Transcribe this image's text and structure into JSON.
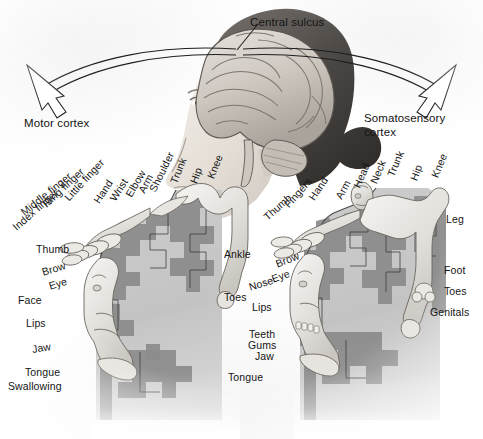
{
  "figure": {
    "background_color": "#ffffff",
    "text_color": "#151515",
    "cortex_light_gray": "#c6c6c6",
    "cortex_dark_gray": "#8b8b8b",
    "body_light": "#ededed",
    "outline_color": "#2b2b2b"
  },
  "callouts": {
    "central_sulcus": "Central sulcus",
    "motor_cortex": "Motor cortex",
    "somatosensory_cortex_line1": "Somatosensory",
    "somatosensory_cortex_line2": "cortex"
  },
  "motor_homunculus": {
    "panel_label": "Motor cortex",
    "arc_labels": [
      {
        "text": "Index finger",
        "x": 14,
        "y": 222,
        "angle": -41
      },
      {
        "text": "Middle finger",
        "x": 22,
        "y": 207,
        "angle": -39
      },
      {
        "text": "Ring finger",
        "x": 44,
        "y": 199,
        "angle": -43
      },
      {
        "text": "Little finger",
        "x": 66,
        "y": 193,
        "angle": -47
      },
      {
        "text": "Hand",
        "x": 96,
        "y": 196,
        "angle": -55
      },
      {
        "text": "Wrist",
        "x": 112,
        "y": 194,
        "angle": -57
      },
      {
        "text": "Elbow",
        "x": 128,
        "y": 190,
        "angle": -60
      },
      {
        "text": "Arm",
        "x": 139,
        "y": 186,
        "angle": -62
      },
      {
        "text": "Shoulder",
        "x": 151,
        "y": 185,
        "angle": -64
      },
      {
        "text": "Trunk",
        "x": 172,
        "y": 177,
        "angle": -68
      },
      {
        "text": "Hip",
        "x": 192,
        "y": 177,
        "angle": -70
      },
      {
        "text": "Knee",
        "x": 209,
        "y": 172,
        "angle": -68
      }
    ],
    "side_labels": [
      {
        "text": "Thumb",
        "x": 36,
        "y": 243
      },
      {
        "text": "Brow",
        "x": 42,
        "y": 268,
        "angle": -17
      },
      {
        "text": "Eye",
        "x": 49,
        "y": 282,
        "angle": -17
      },
      {
        "text": "Face",
        "x": 18,
        "y": 294
      },
      {
        "text": "Lips",
        "x": 26,
        "y": 317
      },
      {
        "text": "Jaw",
        "x": 32,
        "y": 344,
        "angle": -10
      },
      {
        "text": "Tongue",
        "x": 25,
        "y": 366
      },
      {
        "text": "Swallowing",
        "x": 8,
        "y": 380
      }
    ],
    "right_labels": [
      {
        "text": "Ankle",
        "x": 224,
        "y": 248
      },
      {
        "text": "Toes",
        "x": 224,
        "y": 291
      }
    ]
  },
  "somatosensory_homunculus": {
    "panel_label": "Somatosensory cortex",
    "arc_labels": [
      {
        "text": "Thumb",
        "x": 265,
        "y": 212,
        "angle": -42
      },
      {
        "text": "Fingers",
        "x": 286,
        "y": 200,
        "angle": -48
      },
      {
        "text": "Hand",
        "x": 310,
        "y": 193,
        "angle": -55
      },
      {
        "text": "Arm",
        "x": 337,
        "y": 192,
        "angle": -60
      },
      {
        "text": "Head",
        "x": 355,
        "y": 181,
        "angle": -66
      },
      {
        "text": "Neck",
        "x": 372,
        "y": 177,
        "angle": -67
      },
      {
        "text": "Trunk",
        "x": 389,
        "y": 170,
        "angle": -67
      },
      {
        "text": "Hip",
        "x": 412,
        "y": 174,
        "angle": -69
      },
      {
        "text": "Knee",
        "x": 433,
        "y": 171,
        "angle": -67
      }
    ],
    "side_labels": [
      {
        "text": "Brow",
        "x": 276,
        "y": 260,
        "angle": -22
      },
      {
        "text": "Eye",
        "x": 272,
        "y": 275,
        "angle": -20
      },
      {
        "text": "Nose",
        "x": 250,
        "y": 282,
        "angle": -17
      },
      {
        "text": "Lips",
        "x": 252,
        "y": 301
      },
      {
        "text": "Teeth",
        "x": 248,
        "y": 328
      },
      {
        "text": "Gums",
        "x": 248,
        "y": 339
      },
      {
        "text": "Jaw",
        "x": 253,
        "y": 350
      },
      {
        "text": "Tongue",
        "x": 236,
        "y": 371
      }
    ],
    "right_labels": [
      {
        "text": "Leg",
        "x": 446,
        "y": 213
      },
      {
        "text": "Foot",
        "x": 444,
        "y": 264
      },
      {
        "text": "Toes",
        "x": 444,
        "y": 285
      },
      {
        "text": "Genitals",
        "x": 437,
        "y": 291
      }
    ]
  }
}
